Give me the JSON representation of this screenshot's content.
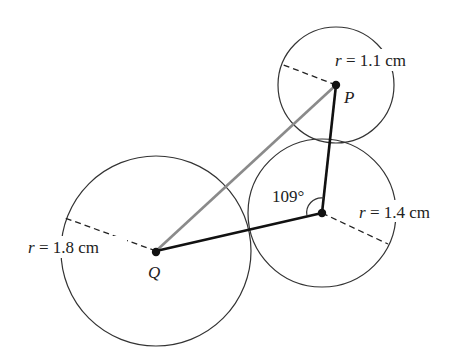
{
  "diagram": {
    "circles": [
      {
        "name": "small",
        "center_label": "P",
        "radius_label": "r = 1.1 cm",
        "radius_var": "r",
        "radius_value": "= 1.1 cm"
      },
      {
        "name": "middle",
        "center_label": "",
        "radius_label": "r = 1.4 cm",
        "radius_var": "r",
        "radius_value": "= 1.4 cm"
      },
      {
        "name": "large",
        "center_label": "Q",
        "radius_label": "r = 1.8 cm",
        "radius_var": "r",
        "radius_value": "= 1.8 cm"
      }
    ],
    "angle_label": "109°",
    "colors": {
      "line": "#111111",
      "pq_line": "#8a8a8a",
      "circle": "#333333"
    }
  }
}
